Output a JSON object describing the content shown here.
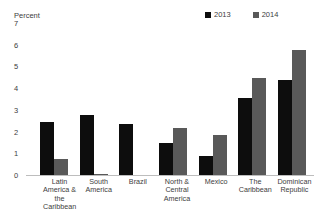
{
  "chart_data": {
    "type": "bar",
    "title": "",
    "xlabel": "",
    "ylabel": "Percent",
    "ylim": [
      0,
      7
    ],
    "yticks": [
      7,
      6,
      5,
      4,
      3,
      2,
      1,
      0
    ],
    "grid": false,
    "legend_position": "top-right",
    "categories": [
      "Latin America & the Caribbean",
      "South America",
      "Brazil",
      "North & Central America",
      "Mexico",
      "The Caribbean",
      "Dominican Republic"
    ],
    "category_lines": [
      [
        "Latin",
        "America &",
        "the",
        "Caribbean"
      ],
      [
        "South",
        "America"
      ],
      [
        "Brazil"
      ],
      [
        "North &",
        "Central",
        "America"
      ],
      [
        "Mexico"
      ],
      [
        "The",
        "Caribbean"
      ],
      [
        "Dominican",
        "Republic"
      ]
    ],
    "series": [
      {
        "name": "2013",
        "color": "#0d0d0d",
        "values": [
          2.5,
          2.8,
          2.4,
          1.5,
          0.9,
          3.6,
          4.4
        ]
      },
      {
        "name": "2014",
        "color": "#595959",
        "values": [
          0.8,
          0.1,
          0.05,
          2.2,
          1.9,
          4.5,
          5.8
        ]
      }
    ]
  },
  "legend": {
    "entries": [
      {
        "label": "2013",
        "color": "#0d0d0d"
      },
      {
        "label": "2014",
        "color": "#595959"
      }
    ]
  },
  "axis": {
    "y_title": "Percent",
    "y_ticks": [
      "7",
      "6",
      "5",
      "4",
      "3",
      "2",
      "1",
      "0"
    ]
  }
}
